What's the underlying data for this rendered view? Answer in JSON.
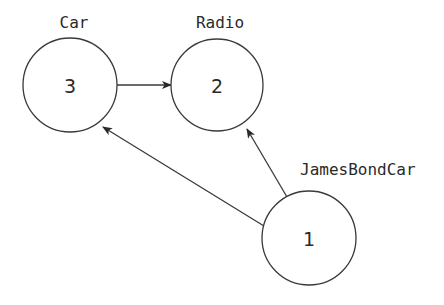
{
  "diagram": {
    "type": "directed-graph",
    "colors": {
      "stroke": "#3a3a3a",
      "text": "#2a2a2a",
      "background": "#ffffff"
    },
    "nodes": [
      {
        "id": "car",
        "label": "Car",
        "number": "3",
        "cx": 70,
        "cy": 85,
        "r": 47,
        "label_x": 74,
        "label_y": 28,
        "label_anchor": "middle"
      },
      {
        "id": "radio",
        "label": "Radio",
        "number": "2",
        "cx": 217,
        "cy": 85,
        "r": 46,
        "label_x": 220,
        "label_y": 28,
        "label_anchor": "middle"
      },
      {
        "id": "jamesbondcar",
        "label": "JamesBondCar",
        "number": "1",
        "cx": 309,
        "cy": 238,
        "r": 47,
        "label_x": 300,
        "label_y": 175,
        "label_anchor": "start"
      }
    ],
    "edges": [
      {
        "from": "car",
        "to": "radio",
        "x1": 117,
        "y1": 85,
        "x2": 171,
        "y2": 85
      },
      {
        "from": "jamesbondcar",
        "to": "car",
        "x1": 264,
        "y1": 226,
        "x2": 103,
        "y2": 127
      },
      {
        "from": "jamesbondcar",
        "to": "radio",
        "x1": 287,
        "y1": 197,
        "x2": 247,
        "y2": 129
      }
    ]
  }
}
